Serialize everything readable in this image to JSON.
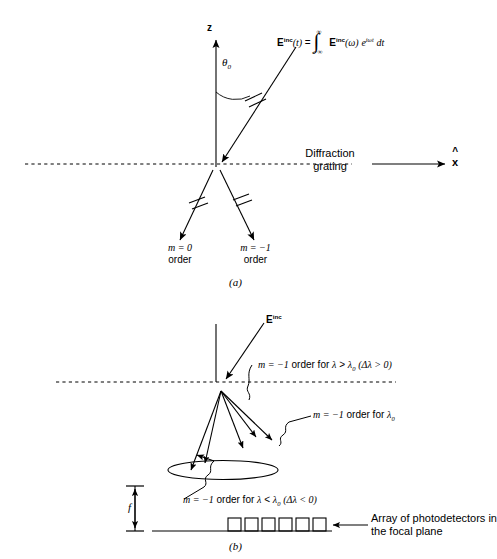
{
  "figure": {
    "background": "#ffffff",
    "stroke": "#000000",
    "panels": [
      {
        "id": "a",
        "caption": "(a)",
        "axes": {
          "z_label": "z",
          "x_label": "x"
        },
        "angle_label": "θ",
        "angle_sub": "0",
        "equation": {
          "lhs_bold": "E",
          "lhs_sup": "inc",
          "lhs_arg": "(t)",
          "equals": "=",
          "integral": "∫",
          "limit_upper": "∞",
          "limit_lower": "−∞",
          "rhs_bold": "E",
          "rhs_sup": "inc",
          "rhs_arg": "(ω)",
          "exp_base": "e",
          "exp_sup": "iωt",
          "differential": "dt",
          "full_text": "E^inc(t) = ∫_{-∞}^{∞} E^inc(ω) e^{iωt} dt"
        },
        "grating_label_line1": "Diffraction",
        "grating_label_line2": "grating",
        "orders": [
          {
            "math": "m = 0",
            "word": "order"
          },
          {
            "math": "m = −1",
            "word": "order"
          }
        ]
      },
      {
        "id": "b",
        "caption": "(b)",
        "incident_label_bold": "E",
        "incident_label_sup": "inc",
        "focal_label": "f",
        "annotations": [
          "m = −1 order for λ > λ0 (Δλ > 0)",
          "m = −1 order for λ0",
          "m = −1 order for λ < λ0 (Δλ < 0)"
        ],
        "annotation_parts": [
          {
            "m": "m = −1",
            "mid": " order for ",
            "lam": "λ",
            "rel": " > ",
            "lam0": "λ",
            "lam0sub": "0",
            "paren": "(Δλ > 0)"
          },
          {
            "m": "m = −1",
            "mid": " order for ",
            "lam0": "λ",
            "lam0sub": "0"
          },
          {
            "m": "m = −1",
            "mid": " order for ",
            "lam": "λ",
            "rel": " < ",
            "lam0": "λ",
            "lam0sub": "0",
            "paren": "(Δλ < 0)"
          }
        ],
        "detector_label_line1": "Array of photodetectors in",
        "detector_label_line2": "the focal plane",
        "detector_count": 6
      }
    ]
  }
}
